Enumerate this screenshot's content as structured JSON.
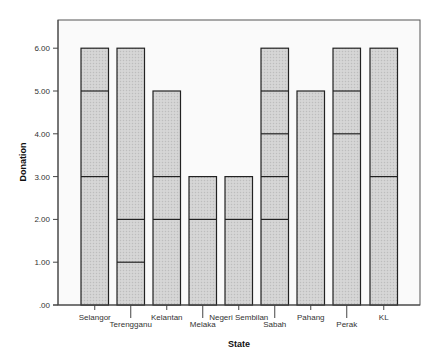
{
  "chart_data": {
    "type": "bar",
    "subtype": "stacked-segment-bar",
    "title": "",
    "xlabel": "State",
    "ylabel": "Donation",
    "ylim": [
      0,
      6.6
    ],
    "yticks": [
      0,
      1,
      2,
      3,
      4,
      5,
      6
    ],
    "ytick_labels": [
      ".00",
      "1.00",
      "2.00",
      "3.00",
      "4.00",
      "5.00",
      "6.00"
    ],
    "grid": false,
    "legend": null,
    "categories": [
      "Selangor",
      "Terengganu",
      "Kelantan",
      "Melaka",
      "Negeri Sembilan",
      "Sabah",
      "Pahang",
      "Perak",
      "KL"
    ],
    "values": [
      6,
      6,
      5,
      3,
      3,
      6,
      5,
      6,
      6
    ],
    "segment_boundaries": [
      [
        3,
        5,
        6
      ],
      [
        1,
        2,
        6
      ],
      [
        2,
        3,
        5
      ],
      [
        2,
        3
      ],
      [
        2,
        3
      ],
      [
        2,
        3,
        4,
        5,
        6
      ],
      [
        5
      ],
      [
        4,
        5,
        6
      ],
      [
        3,
        6
      ]
    ],
    "bar_fill": "#cfcfcf",
    "bar_stroke": "#222222",
    "plot_background": "#fafafa"
  }
}
